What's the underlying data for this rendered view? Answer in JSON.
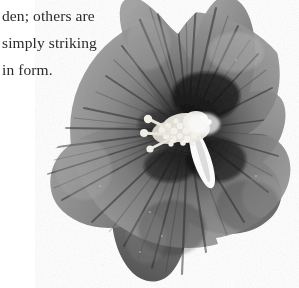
{
  "page": {
    "background_color": "#ffffff",
    "width": 299,
    "height": 288
  },
  "caption": {
    "lines": [
      "den; others are",
      "simply striking",
      "in form."
    ],
    "line_1": "den; others are",
    "line_2": "simply striking",
    "line_3": "in form.",
    "text_color": "#2b2b2b"
  },
  "photo": {
    "subject": "hibiscus-flower",
    "alt_text": "Grayscale photograph of a five-petaled hibiscus (rose of Sharon) blossom with a dark throat and a pale stamen column",
    "is_grayscale": true,
    "petal_count": 5,
    "colors": {
      "background": "#ffffff",
      "petal_light": "#a8a8a8",
      "petal_mid": "#8a8a8a",
      "petal_mid_dark": "#6e6e6e",
      "petal_dark": "#4a4a4a",
      "petal_shadow": "#3a3a3a",
      "throat_dark": "#141414",
      "throat_black": "#080808",
      "vein_dark": "#3c3c3c",
      "stamen_white": "#fdfdfd",
      "stamen_cream": "#e8e6e0",
      "style_white": "#ffffff"
    },
    "center": {
      "x": 188,
      "y": 130
    },
    "bounds": {
      "left": 40,
      "top": 0,
      "right": 287,
      "bottom": 286
    }
  }
}
